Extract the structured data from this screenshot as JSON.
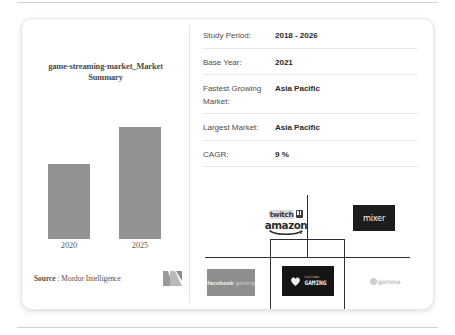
{
  "chart_data": {
    "type": "bar",
    "title": "game-streaming-market_Market Summary",
    "categories": [
      "2020",
      "2025"
    ],
    "values": [
      75,
      112
    ],
    "xlabel": "",
    "ylabel": "",
    "grid": false,
    "legend": "none",
    "bar_color": "#929292",
    "note": "Unlabeled relative market-size bars; 2025 bar is about 1.5x the 2020 bar."
  },
  "chart_panel": {
    "title": "game-streaming-market_Market Summary",
    "x_labels": [
      "2020",
      "2025"
    ],
    "source_bold": "Source",
    "source_rest": " : Mordor Intelligence",
    "logo_name": "mordor-intelligence-logo"
  },
  "spec_table": {
    "rows": [
      {
        "label": "Study Period:",
        "value": "2018 - 2026"
      },
      {
        "label": "Base Year:",
        "value": "2021"
      },
      {
        "label": "Fastest Growing Market:",
        "value": "Asia Pacific"
      },
      {
        "label": "Largest Market:",
        "value": "Asia Pacific"
      },
      {
        "label": "CAGR:",
        "value": "9 %"
      }
    ]
  },
  "logo_tree": {
    "twitch_label": "twitch",
    "amazon_label": "amazon",
    "mixer_label": "mixer",
    "facebook_label_bold": "facebook",
    "facebook_label_light": " gaming",
    "youtube_top_label": "YouTube",
    "youtube_bottom_label": "GAMING",
    "fifth_label": "garena"
  },
  "colors": {
    "bar": "#929292",
    "card_border": "#e8e8e8",
    "row_divider": "#eaeaea",
    "tree_line": "#2f2f2f",
    "dark_box": "#1d1d1d",
    "gray_box": "#8e8e8e"
  }
}
